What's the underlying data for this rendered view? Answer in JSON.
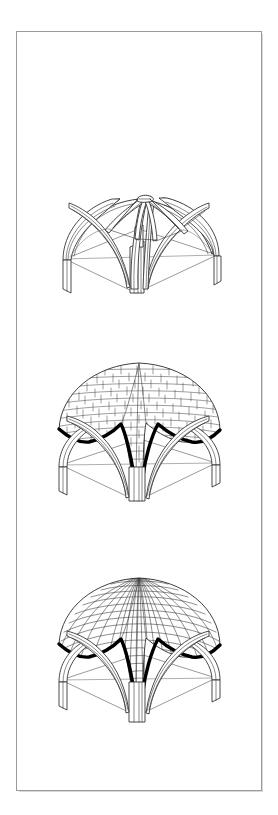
{
  "document": {
    "kind": "architectural-illustration-plate",
    "title": "",
    "page_background": "#ffffff",
    "sheet_background": "#ffffff",
    "sheet_border_color": "#9a9a9a",
    "ink_color": "#2b2b2b",
    "accent_color": "#000000",
    "orientation": "portrait",
    "text_present": "none"
  },
  "figures": [
    {
      "index": 1,
      "caption": "",
      "name": "rib-frame-stage",
      "subject": "ribbed vault skeleton",
      "stage_label": "",
      "description": "Square-plan domical ribbed vault shown as bare stone rib armature with four corner piers, four wall arches, two diagonal ridge ribs and intermediate tiercerons converging on a central apex boss; ground plan outlined in perspective.",
      "web_infill": "none",
      "masonry_pattern": "none",
      "highlight_band": "none",
      "element_counts": {
        "piers": 4,
        "wall_arches": 4,
        "diagonal_ribs": 4,
        "tiercerons": 8,
        "apex_boss": 1
      }
    },
    {
      "index": 2,
      "caption": "",
      "name": "coursed-web-stage",
      "subject": "ribbed vault with coursed masonry web",
      "stage_label": "",
      "description": "Same vault with the cells filled by horizontal courses of ashlar blocks rising from the haunches to the crown; the line where the web meets the transverse arches is drawn as a heavy black band.",
      "web_infill": "coursed ashlar",
      "masonry_pattern": "horizontal-courses",
      "highlight_band": "heavy-black-edge",
      "element_counts": {
        "piers": 4,
        "wall_arches": 4,
        "web_cells": 4
      }
    },
    {
      "index": 3,
      "caption": "",
      "name": "radial-web-stage",
      "subject": "ribbed vault with radial fan-coursed web",
      "stage_label": "",
      "description": "Same vault with the cells filled by curved, fan-shaped courses radiating from the crown down to the arch springings; heavy black band again marks the web-to-arch junction.",
      "web_infill": "radial fan coursing",
      "masonry_pattern": "radial-fan-courses",
      "highlight_band": "heavy-black-edge",
      "element_counts": {
        "piers": 4,
        "wall_arches": 4,
        "web_cells": 4
      }
    }
  ],
  "legend": {
    "items": []
  },
  "annotations": []
}
